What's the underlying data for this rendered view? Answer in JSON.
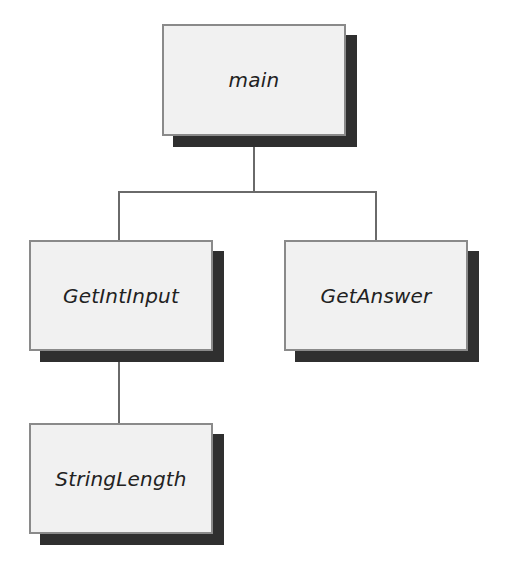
{
  "diagram": {
    "type": "hierarchy-chart",
    "nodes": [
      {
        "id": "main",
        "label": "main",
        "x": 162,
        "y": 24,
        "w": 184,
        "h": 112
      },
      {
        "id": "getintinput",
        "label": "GetIntInput",
        "x": 29,
        "y": 240,
        "w": 184,
        "h": 111
      },
      {
        "id": "getanswer",
        "label": "GetAnswer",
        "x": 284,
        "y": 240,
        "w": 184,
        "h": 111
      },
      {
        "id": "stringlength",
        "label": "StringLength",
        "x": 29,
        "y": 423,
        "w": 184,
        "h": 111
      }
    ],
    "edges": [
      {
        "from": "main",
        "to": "getintinput"
      },
      {
        "from": "main",
        "to": "getanswer"
      },
      {
        "from": "getintinput",
        "to": "stringlength"
      }
    ],
    "colors": {
      "box_fill": "#f1f1f1",
      "box_border": "#8a8a8a",
      "shadow": "#2f2f2f",
      "connector": "#6a6a6a",
      "text": "#222222"
    }
  }
}
